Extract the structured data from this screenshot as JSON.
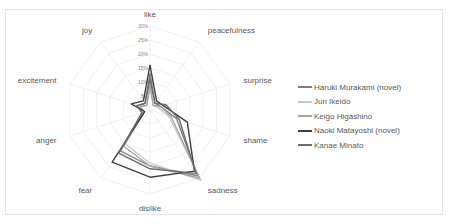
{
  "chart_data": {
    "type": "radar",
    "title": "",
    "axes": [
      "like",
      "peacefulness",
      "surprise",
      "shame",
      "sadness",
      "dislike",
      "fear",
      "anger",
      "excitement",
      "joy"
    ],
    "radial_ticks": [
      "0%",
      "5%",
      "10%",
      "15%",
      "20%",
      "25%",
      "30%"
    ],
    "rlim": [
      0,
      30
    ],
    "grid": true,
    "legend_position": "right",
    "series": [
      {
        "name": "Haruki Murakami (novel)",
        "color": "#7f7f7f",
        "values": [
          13,
          3,
          4,
          10,
          29,
          20,
          18,
          2,
          4,
          3
        ]
      },
      {
        "name": "Jun Ikeido",
        "color": "#c9c9c9",
        "values": [
          8,
          2,
          3,
          7,
          31,
          19,
          15,
          3,
          5,
          2
        ]
      },
      {
        "name": "Keigo Higashino",
        "color": "#a5a5a5",
        "values": [
          9,
          2,
          4,
          8,
          30,
          20,
          16,
          3,
          4,
          2
        ]
      },
      {
        "name": "Naoki Matayoshi (novel)",
        "color": "#404040",
        "values": [
          16,
          4,
          5,
          14,
          27,
          24,
          23,
          2,
          7,
          4
        ]
      },
      {
        "name": "Kanae Minato",
        "color": "#6b6b6b",
        "values": [
          11,
          3,
          6,
          11,
          28,
          21,
          19,
          3,
          5,
          3
        ]
      }
    ]
  },
  "geometry": {
    "cx": 150,
    "cy": 110,
    "radius": 84
  }
}
